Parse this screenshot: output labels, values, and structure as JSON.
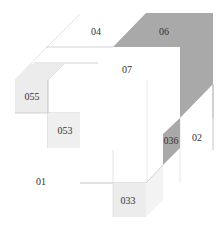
{
  "diagram": {
    "title": "",
    "colors": {
      "background": "#ffffff",
      "dark_gray": "#a9a9a9",
      "light_gray": "#ececec",
      "line": "#b8b8b8",
      "faint_line": "#dcdcdc",
      "text": "#333333"
    },
    "labels": {
      "r04": "04",
      "r06": "06",
      "r07": "07",
      "r055": "055",
      "r053": "053",
      "r036": "036",
      "r02": "02",
      "r01": "01",
      "r033": "033"
    }
  }
}
